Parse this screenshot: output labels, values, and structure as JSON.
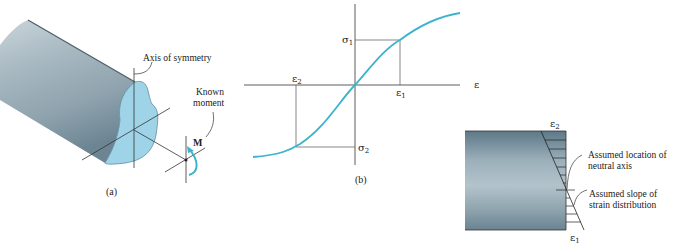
{
  "colors": {
    "curve": "#3bb3cc",
    "section_face": "#9fd4e8",
    "shaft_body": "#9fb0ba",
    "beam_body": "#7e98a6",
    "ink": "#222222"
  },
  "panel_a": {
    "caption": "(a)",
    "label_axis_symmetry": "Axis of symmetry",
    "label_known_moment_1": "Known",
    "label_known_moment_2": "moment",
    "moment_symbol": "M"
  },
  "panel_b": {
    "caption": "(b)",
    "axis_x_label": "ε",
    "sigma1": "σ",
    "sigma1_sub": "1",
    "sigma2": "σ",
    "sigma2_sub": "2",
    "eps1": "ε",
    "eps1_sub": "1",
    "eps2": "ε",
    "eps2_sub": "2"
  },
  "panel_c": {
    "eps2": "ε",
    "eps2_sub": "2",
    "eps1": "ε",
    "eps1_sub": "1",
    "label_neutral_1": "Assumed location of",
    "label_neutral_2": "neutral axis",
    "label_slope_1": "Assumed slope of",
    "label_slope_2": "strain distribution"
  }
}
